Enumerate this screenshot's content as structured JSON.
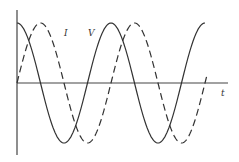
{
  "chart_data": {
    "type": "line",
    "title": "",
    "xlabel": "t",
    "ylabel": "",
    "grid": false,
    "legend": "none (inline curve labels)",
    "x_range_periods": [
      0,
      1.96
    ],
    "series": [
      {
        "name": "V",
        "style": "solid",
        "function": "cos",
        "amplitude": 1,
        "phase_deg": 0
      },
      {
        "name": "I",
        "style": "dashed",
        "function": "sin",
        "amplitude": 1,
        "phase_deg": -90
      }
    ],
    "annotations": [
      {
        "text": "I",
        "near": "first dashed peak descending"
      },
      {
        "text": "V",
        "near": "solid curve rising before second peak"
      },
      {
        "text": "t",
        "near": "end of horizontal axis"
      }
    ]
  },
  "labels": {
    "current": "I",
    "voltage": "V",
    "time": "t"
  },
  "colors": {
    "curve": "#333333",
    "axis": "#444444",
    "background": "#ffffff"
  }
}
